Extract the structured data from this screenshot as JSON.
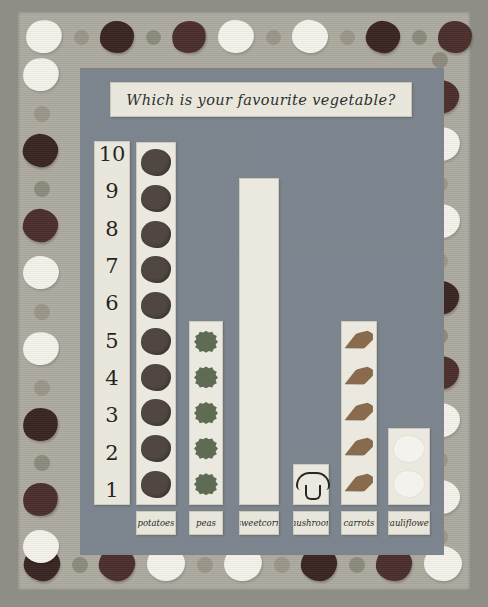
{
  "poster": {
    "title": "Which is your favourite vegetable?",
    "medium": "classroom pictogram poster with printed vegetable border"
  },
  "colors": {
    "panel": "#7d8690",
    "paper": "#f0eee2",
    "border_sheet": "#adaba0",
    "potato": "#4e443e",
    "pea": "#5d6b52",
    "corn": "#f2f0e6",
    "mushroom_outline": "#23211e",
    "carrot": "#8a6a4a",
    "cauliflower": "#fbfaf5"
  },
  "chart_data": {
    "type": "bar",
    "title": "Which is your favourite vegetable?",
    "xlabel": "",
    "ylabel": "",
    "ylim": [
      0,
      10
    ],
    "grid": false,
    "legend": "none",
    "categories": [
      "potatoes",
      "peas",
      "sweetcorn",
      "mushroom",
      "carrots",
      "cauliflower"
    ],
    "values": [
      10,
      5,
      9,
      1,
      5,
      2
    ],
    "y_ticks": [
      "10",
      "9",
      "8",
      "7",
      "6",
      "5",
      "4",
      "3",
      "2",
      "1"
    ]
  },
  "yaxis": {
    "ticks": [
      "10",
      "9",
      "8",
      "7",
      "6",
      "5",
      "4",
      "3",
      "2",
      "1"
    ]
  },
  "bars": [
    {
      "key": "potatoes",
      "label": "potatoes",
      "value": 10,
      "glyph": "g-potato",
      "glyph_name": "potato-stamp"
    },
    {
      "key": "peas",
      "label": "peas",
      "value": 5,
      "glyph": "g-pea",
      "glyph_name": "pea-stamp"
    },
    {
      "key": "sweetcorn",
      "label": "sweetcorn",
      "value": 9,
      "glyph": "g-corn",
      "glyph_name": "blank-stamp"
    },
    {
      "key": "mushroom",
      "label": "mushroom",
      "value": 1,
      "glyph": "g-mushroom",
      "glyph_name": "mushroom-stamp"
    },
    {
      "key": "carrots",
      "label": "carrots",
      "value": 5,
      "glyph": "g-carrot",
      "glyph_name": "carrot-stamp"
    },
    {
      "key": "cauliflower",
      "label": "cauliflower",
      "value": 2,
      "glyph": "g-cauli",
      "glyph_name": "cauliflower-stamp"
    }
  ],
  "border_decor": {
    "description": "hand-printed potato, cauliflower and round vegetable stamps around all four edges"
  }
}
